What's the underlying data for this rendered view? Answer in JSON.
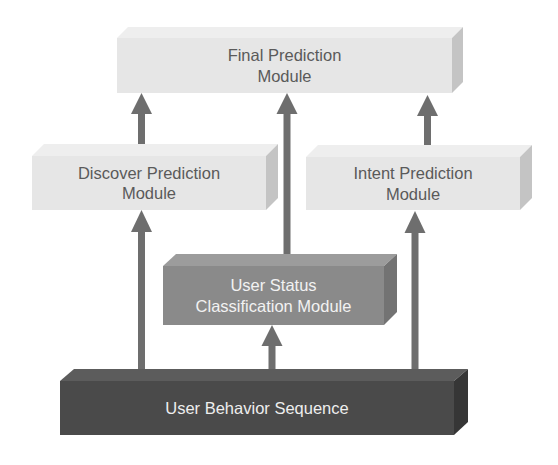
{
  "diagram": {
    "modules": {
      "final": {
        "label": "Final Prediction\nModule",
        "color": "#e6e6e6",
        "text_color": "#5a5a5a"
      },
      "discover": {
        "label": "Discover Prediction\nModule",
        "color": "#e6e6e6",
        "text_color": "#5a5a5a"
      },
      "intent": {
        "label": "Intent Prediction\nModule",
        "color": "#e6e6e6",
        "text_color": "#5a5a5a"
      },
      "status": {
        "label": "User Status\nClassification Module",
        "color": "#8a8a8a",
        "text_color": "#f2f2f2"
      },
      "sequence": {
        "label": "User Behavior Sequence",
        "color": "#4a4a4a",
        "text_color": "#eeeeee"
      }
    },
    "edges": [
      {
        "from": "sequence",
        "to": "discover"
      },
      {
        "from": "sequence",
        "to": "status"
      },
      {
        "from": "sequence",
        "to": "intent"
      },
      {
        "from": "discover",
        "to": "final"
      },
      {
        "from": "status",
        "to": "final"
      },
      {
        "from": "intent",
        "to": "final"
      }
    ],
    "arrow_color": "#6e6e6e"
  }
}
